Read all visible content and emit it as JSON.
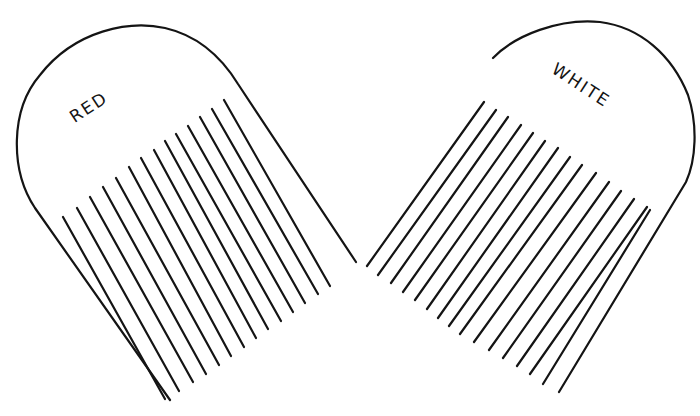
{
  "diagram": {
    "stroke_color": "#141414",
    "background": "#ffffff",
    "combs": [
      {
        "id": "red",
        "label": "RED",
        "label_pos": [
          92,
          112
        ],
        "label_rotate": -33,
        "outline": "M 170 400 L 35 208 C 10 170 10 110 40 75 C 75 30 130 20 165 28 C 200 36 222 58 238 84 L 356 262",
        "teeth": [
          [
            63,
            217,
            165,
            399
          ],
          [
            77,
            208,
            179,
            391
          ],
          [
            90,
            197,
            193,
            382
          ],
          [
            103,
            187,
            206,
            374
          ],
          [
            116,
            178,
            219,
            365
          ],
          [
            129,
            167,
            231,
            356
          ],
          [
            141,
            158,
            244,
            347
          ],
          [
            154,
            150,
            256,
            338
          ],
          [
            165,
            141,
            268,
            329
          ],
          [
            176,
            134,
            281,
            321
          ],
          [
            188,
            126,
            293,
            312
          ],
          [
            200,
            117,
            305,
            303
          ],
          [
            212,
            109,
            318,
            294
          ],
          [
            224,
            100,
            330,
            286
          ]
        ]
      },
      {
        "id": "white",
        "label": "WHITE",
        "label_pos": [
          578,
          90
        ],
        "label_rotate": 33,
        "outline": "M 493 58 C 515 35 560 18 600 22 C 640 27 672 55 688 95 C 698 125 696 160 686 182 L 559 392",
        "teeth": [
          [
            484,
            102,
            367,
            266
          ],
          [
            496,
            110,
            378,
            275
          ],
          [
            508,
            117,
            391,
            283
          ],
          [
            521,
            125,
            403,
            292
          ],
          [
            533,
            133,
            415,
            300
          ],
          [
            545,
            141,
            427,
            309
          ],
          [
            558,
            148,
            438,
            318
          ],
          [
            570,
            157,
            449,
            326
          ],
          [
            582,
            165,
            460,
            334
          ],
          [
            596,
            173,
            474,
            342
          ],
          [
            609,
            182,
            489,
            350
          ],
          [
            621,
            191,
            503,
            358
          ],
          [
            634,
            199,
            517,
            366
          ],
          [
            647,
            207,
            530,
            374
          ],
          [
            650,
            210,
            543,
            384
          ]
        ]
      }
    ]
  }
}
